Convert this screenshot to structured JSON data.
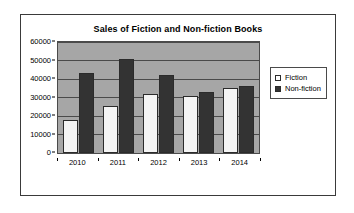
{
  "chart_data": {
    "type": "bar",
    "title": "Sales of Fiction and Non-fiction Books",
    "xlabel": "",
    "ylabel": "",
    "categories": [
      "2010",
      "2011",
      "2012",
      "2013",
      "2014"
    ],
    "series": [
      {
        "name": "Fiction",
        "color": "#ffffff",
        "values": [
          18000,
          25500,
          32000,
          31000,
          35000
        ]
      },
      {
        "name": "Non-fiction",
        "color": "#333333",
        "values": [
          43000,
          51000,
          42000,
          33000,
          36000
        ]
      }
    ],
    "ylim": [
      0,
      60000
    ],
    "y_ticks": [
      0,
      10000,
      20000,
      30000,
      40000,
      50000,
      60000
    ],
    "y_tick_labels": [
      "0",
      "10000",
      "20000",
      "30000",
      "40000",
      "50000",
      "60000"
    ],
    "grid": true,
    "legend_position": "right",
    "plot_background": "#a6a6a6",
    "frame_color": "#3a3a3a"
  }
}
